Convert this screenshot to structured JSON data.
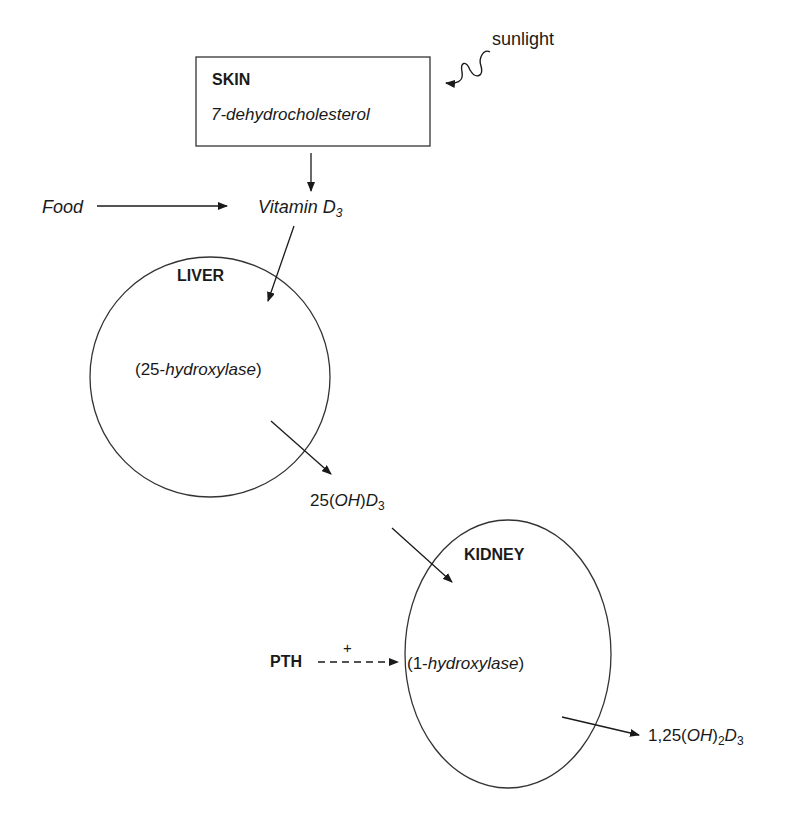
{
  "diagram": {
    "skin": {
      "title": "SKIN",
      "compound": "7-dehydrocholesterol"
    },
    "sunlight": "sunlight",
    "food": "Food",
    "vitamin_d3": {
      "base": "Vitamin D",
      "sub": "3"
    },
    "liver": {
      "title": "LIVER",
      "enzyme_prefix": "(25-",
      "enzyme_name": "hydroxylase",
      "enzyme_suffix": ")"
    },
    "calcidiol": {
      "prefix": "25(",
      "oh": "OH",
      "mid": ")",
      "d": "D",
      "sub": "3"
    },
    "kidney": {
      "title": "KIDNEY",
      "enzyme_prefix": "(1-",
      "enzyme_name": "hydroxylase",
      "enzyme_suffix": ")"
    },
    "pth": {
      "label": "PTH",
      "effect": "+"
    },
    "calcitriol": {
      "prefix": "1,25(",
      "oh": "OH",
      "mid": ")",
      "sub1": "2",
      "d": "D",
      "sub2": "3"
    }
  }
}
